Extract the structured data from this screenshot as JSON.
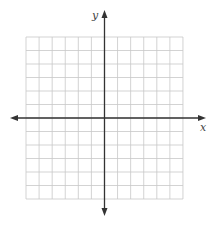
{
  "diagram": {
    "type": "coordinate-plane",
    "grid": {
      "columns": 12,
      "rows": 12,
      "left": 26,
      "top": 37,
      "cell_width": 13.08,
      "cell_height": 13.5,
      "line_color": "#c8c8c8"
    },
    "axes": {
      "color": "#333333",
      "x_axis": {
        "label": "x",
        "y_position": 118,
        "from": 10,
        "to": 206,
        "label_x": 200,
        "label_y": 131
      },
      "y_axis": {
        "label": "y",
        "x_position": 104.5,
        "from": 10,
        "to": 216,
        "label_x": 92,
        "label_y": 19
      }
    }
  }
}
